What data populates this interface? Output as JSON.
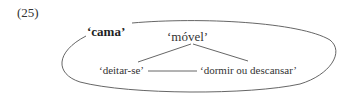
{
  "example_number": "(25)",
  "frame_label": "‘cama’",
  "root": "‘móvel’",
  "left_leaf": "‘deitar-se’",
  "right_leaf": "‘dormir ou descansar’",
  "colors": {
    "text": "#333333",
    "lines": "#555555"
  }
}
